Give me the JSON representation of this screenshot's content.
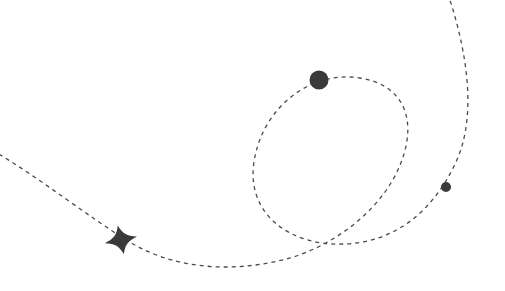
{
  "canvas": {
    "width": 505,
    "height": 291,
    "background_color": "#ffffff",
    "title": "Dashed looping trajectory illustration"
  },
  "style": {
    "stroke_color": "#4a4a4a",
    "stroke_width": 1.3,
    "dash_pattern": "4 4",
    "marker_color": "#3a3a3a"
  },
  "chart_data": {
    "type": "line",
    "title": "",
    "subtitle": "",
    "xlabel": "",
    "ylabel": "",
    "grid": false,
    "legend": "none",
    "xlim": [
      0,
      505
    ],
    "ylim": [
      0,
      291
    ],
    "series": [
      {
        "name": "looping-trajectory",
        "style": "dashed",
        "color": "#4a4a4a",
        "path": "M -8 150 C 40 178, 90 218, 128 241 C 178 272, 240 272, 290 258 C 340 243, 386 205, 402 160 C 418 115, 400 84, 360 78 C 310 70, 262 108, 254 162 C 246 214, 290 246, 343 244 C 392 243, 432 214, 456 162 C 478 114, 466 48, 448 -6",
        "points": [
          {
            "x": -8,
            "y": 150
          },
          {
            "x": 128,
            "y": 241
          },
          {
            "x": 245,
            "y": 267
          },
          {
            "x": 343,
            "y": 244
          },
          {
            "x": 402,
            "y": 160
          },
          {
            "x": 319,
            "y": 80
          },
          {
            "x": 254,
            "y": 162
          },
          {
            "x": 446,
            "y": 187
          },
          {
            "x": 448,
            "y": -6
          }
        ]
      }
    ],
    "markers": [
      {
        "name": "large-dot-marker",
        "shape": "circle",
        "x": 319,
        "y": 80,
        "radius": 9.5,
        "color": "#3a3a3a"
      },
      {
        "name": "small-dot-marker",
        "shape": "circle",
        "x": 446,
        "y": 187,
        "radius": 5,
        "color": "#3a3a3a"
      },
      {
        "name": "star-marker",
        "shape": "four-pointed-star",
        "x": 124,
        "y": 240,
        "radius": 12,
        "rotation": -12,
        "color": "#3a3a3a"
      }
    ],
    "annotations": []
  }
}
